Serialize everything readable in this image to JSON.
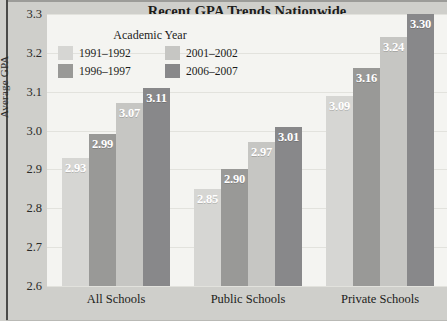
{
  "chart_data": {
    "type": "bar",
    "title": "Recent GPA Trends Nationwide",
    "xlabel": "",
    "ylabel": "Average GPA",
    "categories": [
      "All Schools",
      "Public Schools",
      "Private Schools"
    ],
    "series": [
      {
        "name": "1991–1992",
        "values": [
          2.93,
          2.85,
          3.09
        ],
        "color": "#d6d6d3"
      },
      {
        "name": "1996–1997",
        "values": [
          2.99,
          2.9,
          3.16
        ],
        "color": "#999997"
      },
      {
        "name": "2001–2002",
        "values": [
          3.07,
          2.97,
          3.24
        ],
        "color": "#c6c6c3"
      },
      {
        "name": "2006–2007",
        "values": [
          3.11,
          3.01,
          3.3
        ],
        "color": "#88888a"
      }
    ],
    "ylim": [
      2.6,
      3.3
    ],
    "yticks": [
      "3.3",
      "3.2",
      "3.1",
      "3.0",
      "2.9",
      "2.8",
      "2.7",
      "2.6"
    ],
    "ytick_values": [
      3.3,
      3.2,
      3.1,
      3.0,
      2.9,
      2.8,
      2.7,
      2.6
    ],
    "grid": true,
    "legend_position": "inside-top-left",
    "legend_title": "Academic Year",
    "data_labels": [
      [
        "2.93",
        "2.99",
        "3.07",
        "3.11"
      ],
      [
        "2.85",
        "2.90",
        "2.97",
        "3.01"
      ],
      [
        "3.09",
        "3.16",
        "3.24",
        "3.30"
      ]
    ]
  },
  "colors": {
    "page_background": "#cfcfcb",
    "plot_background": "#f4f4f1",
    "gridline": "#e2e2dd",
    "axis_line": "#4a4a48",
    "text": "#1c1c1a",
    "data_label": "#ffffff"
  }
}
